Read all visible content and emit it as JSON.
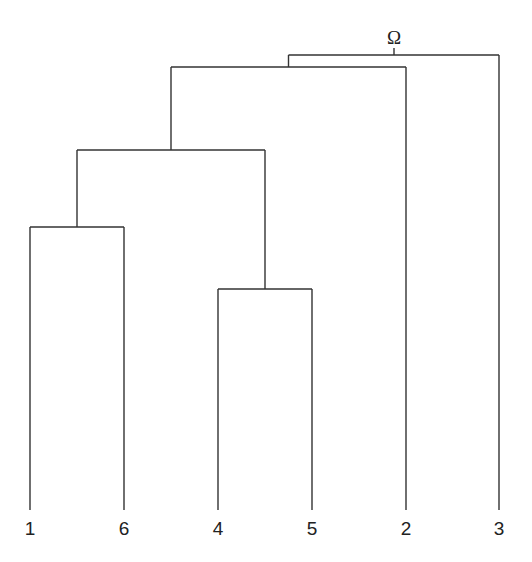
{
  "diagram": {
    "type": "dendrogram",
    "root_label": "Ω",
    "leaf_order": [
      "1",
      "6",
      "4",
      "5",
      "2",
      "3"
    ],
    "leaves": [
      {
        "id": "1",
        "label": "1",
        "x": 30
      },
      {
        "id": "6",
        "label": "6",
        "x": 124
      },
      {
        "id": "4",
        "label": "4",
        "x": 218
      },
      {
        "id": "5",
        "label": "5",
        "x": 312
      },
      {
        "id": "2",
        "label": "2",
        "x": 406
      },
      {
        "id": "3",
        "label": "3",
        "x": 499
      }
    ],
    "merges": [
      {
        "id": "c16",
        "children": [
          "1",
          "6"
        ],
        "y": 227
      },
      {
        "id": "c45",
        "children": [
          "4",
          "5"
        ],
        "y": 289
      },
      {
        "id": "c1645",
        "children": [
          "c16",
          "c45"
        ],
        "y": 150
      },
      {
        "id": "c16452",
        "children": [
          "c1645",
          "2"
        ],
        "y": 67
      },
      {
        "id": "root",
        "children": [
          "c16452",
          "3"
        ],
        "y": 55
      }
    ],
    "baseline_y": 510
  }
}
